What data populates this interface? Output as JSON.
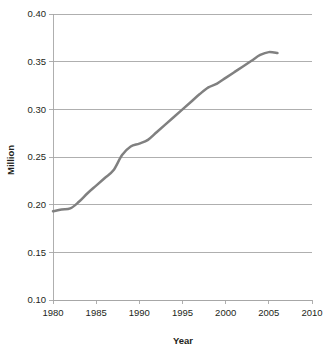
{
  "chart_data": {
    "type": "line",
    "title": "",
    "xlabel": "Year",
    "ylabel": "Million",
    "xlim": [
      1980,
      2010
    ],
    "ylim": [
      0.1,
      0.4
    ],
    "xticks": [
      1980,
      1985,
      1990,
      1995,
      2000,
      2005,
      2010
    ],
    "xtick_labels": [
      "1980",
      "1985",
      "1990",
      "1995",
      "2000",
      "2005",
      "2010"
    ],
    "yticks": [
      0.1,
      0.15,
      0.2,
      0.25,
      0.3,
      0.35,
      0.4
    ],
    "ytick_labels": [
      "0.10",
      "0.15",
      "0.20",
      "0.25",
      "0.30",
      "0.35",
      "0.40"
    ],
    "grid": "horizontal",
    "legend": "none",
    "line_color": "#808080",
    "grid_color": "#a6a6a6",
    "background_color": "#ffffff",
    "x": [
      1980,
      1981,
      1982,
      1983,
      1984,
      1985,
      1986,
      1987,
      1988,
      1989,
      1990,
      1991,
      1992,
      1993,
      1994,
      1995,
      1996,
      1997,
      1998,
      1999,
      2000,
      2001,
      2002,
      2003,
      2004,
      2005,
      2006
    ],
    "values": [
      0.193,
      0.195,
      0.196,
      0.203,
      0.212,
      0.22,
      0.228,
      0.236,
      0.252,
      0.261,
      0.264,
      0.268,
      0.276,
      0.284,
      0.292,
      0.3,
      0.308,
      0.316,
      0.323,
      0.327,
      0.333,
      0.339,
      0.345,
      0.351,
      0.357,
      0.36,
      0.359
    ],
    "series": [
      {
        "name": "Million",
        "values": [
          0.193,
          0.195,
          0.196,
          0.203,
          0.212,
          0.22,
          0.228,
          0.236,
          0.252,
          0.261,
          0.264,
          0.268,
          0.276,
          0.284,
          0.292,
          0.3,
          0.308,
          0.316,
          0.323,
          0.327,
          0.333,
          0.339,
          0.345,
          0.351,
          0.357,
          0.36,
          0.359
        ]
      }
    ]
  }
}
